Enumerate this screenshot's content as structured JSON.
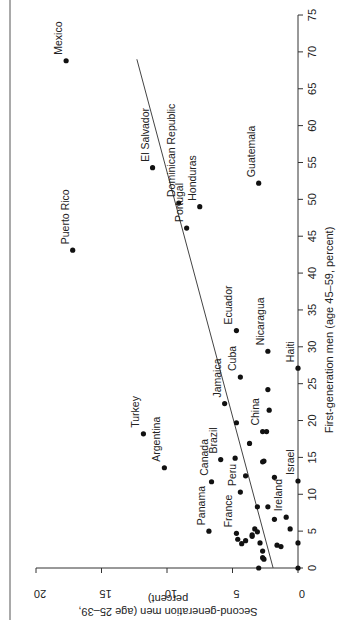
{
  "chart_data": {
    "type": "scatter",
    "orientation_note": "rotated 90 degrees clockwise on page",
    "title": "",
    "xlabel": "First-generation men (age 45–59, percent)",
    "ylabel": "Second-generation men (age 25–39, percent)",
    "xlim": [
      0,
      75
    ],
    "ylim": [
      0,
      20
    ],
    "xticks": [
      0,
      5,
      10,
      15,
      20,
      25,
      30,
      35,
      40,
      45,
      50,
      55,
      60,
      65,
      70,
      75
    ],
    "yticks": [
      0,
      5,
      10,
      15,
      20
    ],
    "grid": false,
    "legend": null,
    "trend_line": {
      "x": [
        0,
        69
      ],
      "y": [
        1.9,
        12.3
      ]
    },
    "labeled_points": [
      {
        "label": "Mexico",
        "x": 68.8,
        "y": 17.7
      },
      {
        "label": "Puerto Rico",
        "x": 43.1,
        "y": 17.2
      },
      {
        "label": "El Salvador",
        "x": 54.3,
        "y": 11.1
      },
      {
        "label": "Dominican Republic",
        "x": 49.5,
        "y": 9.1
      },
      {
        "label": "Honduras",
        "x": 49.0,
        "y": 7.5
      },
      {
        "label": "Portugal",
        "x": 46.1,
        "y": 8.5
      },
      {
        "label": "Guatemala",
        "x": 52.2,
        "y": 3.0
      },
      {
        "label": "Ecuador",
        "x": 32.2,
        "y": 4.7
      },
      {
        "label": "Cuba",
        "x": 25.9,
        "y": 4.4
      },
      {
        "label": "Nicaragua",
        "x": 29.4,
        "y": 2.3
      },
      {
        "label": "Haiti",
        "x": 27.1,
        "y": 0.0
      },
      {
        "label": "Jamaica",
        "x": 22.3,
        "y": 5.6
      },
      {
        "label": "Turkey",
        "x": 18.2,
        "y": 11.8
      },
      {
        "label": "Argentina",
        "x": 13.6,
        "y": 10.2
      },
      {
        "label": "China",
        "x": 18.5,
        "y": 2.7
      },
      {
        "label": "Brazil",
        "x": 14.7,
        "y": 5.9
      },
      {
        "label": "Canada",
        "x": 11.7,
        "y": 6.6
      },
      {
        "label": "Peru",
        "x": 10.3,
        "y": 4.4
      },
      {
        "label": "Israel",
        "x": 11.8,
        "y": 0.0
      },
      {
        "label": "Ireland",
        "x": 6.9,
        "y": 0.9
      },
      {
        "label": "Panama",
        "x": 5.0,
        "y": 6.8
      },
      {
        "label": "France",
        "x": 4.7,
        "y": 4.7
      }
    ],
    "unlabeled_points": [
      {
        "x": 18.5,
        "y": 2.4
      },
      {
        "x": 24.2,
        "y": 2.3
      },
      {
        "x": 21.4,
        "y": 2.2
      },
      {
        "x": 19.7,
        "y": 4.7
      },
      {
        "x": 16.9,
        "y": 3.7
      },
      {
        "x": 14.9,
        "y": 4.8
      },
      {
        "x": 14.5,
        "y": 2.6
      },
      {
        "x": 14.4,
        "y": 2.7
      },
      {
        "x": 12.5,
        "y": 4.0
      },
      {
        "x": 12.3,
        "y": 1.8
      },
      {
        "x": 8.3,
        "y": 3.1
      },
      {
        "x": 8.3,
        "y": 2.3
      },
      {
        "x": 6.6,
        "y": 1.8
      },
      {
        "x": 5.3,
        "y": 3.3
      },
      {
        "x": 5.3,
        "y": 0.6
      },
      {
        "x": 4.9,
        "y": 3.1
      },
      {
        "x": 4.5,
        "y": 3.5
      },
      {
        "x": 4.3,
        "y": 3.5
      },
      {
        "x": 3.9,
        "y": 4.6
      },
      {
        "x": 3.7,
        "y": 4.0
      },
      {
        "x": 3.4,
        "y": 2.9
      },
      {
        "x": 3.3,
        "y": 4.3
      },
      {
        "x": 3.1,
        "y": 1.6
      },
      {
        "x": 2.9,
        "y": 1.3
      },
      {
        "x": 3.4,
        "y": 0.0
      },
      {
        "x": 2.3,
        "y": 2.7
      },
      {
        "x": 1.4,
        "y": 2.7
      },
      {
        "x": 1.2,
        "y": 2.6
      },
      {
        "x": 0.0,
        "y": 3.0
      },
      {
        "x": 0.0,
        "y": 0.0
      }
    ]
  }
}
